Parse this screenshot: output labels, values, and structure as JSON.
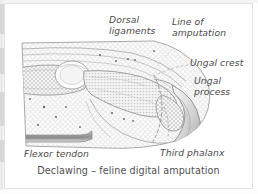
{
  "figure": {
    "caption": "Declawing – feline digital amputation",
    "labels": {
      "dorsal_ligaments": "Dorsal\nligaments",
      "line_of_amputation": "Line of\namputation",
      "ungal_crest": "Ungal crest",
      "ungal_process": "Ungal\nprocess",
      "flexor_tendon": "Flexor tendon",
      "third_phalanx": "Third phalanx"
    },
    "colors": {
      "tissue_fill": "#ececec",
      "stipple": "#ffffff",
      "outline": "#9a9a9a",
      "bone_fill": "#fafafa",
      "trabecular": "#c9c9c9",
      "tendon_dark": "#8d8d8d",
      "claw_shadow": "#b8b8b8",
      "text": "#4a4a4a",
      "frame": "#e3e3e3",
      "background": "#ffffff",
      "dashed_cut": "#8a8a8a"
    },
    "structures": [
      "second phalanx",
      "third phalanx",
      "interphalangeal joint",
      "dorsal ligaments",
      "ungal crest",
      "ungal process",
      "claw horn",
      "flexor tendon",
      "digital pad"
    ]
  }
}
